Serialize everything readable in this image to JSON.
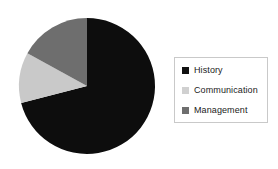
{
  "chart_data": {
    "type": "pie",
    "title": "",
    "categories": [
      "History",
      "Communication",
      "Management"
    ],
    "values": [
      71,
      12,
      17
    ],
    "unit": "percent",
    "slices": [
      {
        "label": "History",
        "value": 71,
        "color": "#0d0d0d",
        "start_angle_deg": 0,
        "end_angle_deg": 255.6
      },
      {
        "label": "Communication",
        "value": 12,
        "color": "#c9c9c9",
        "start_angle_deg": 255.6,
        "end_angle_deg": 298.8
      },
      {
        "label": "Management",
        "value": 17,
        "color": "#6e6e6e",
        "start_angle_deg": 298.8,
        "end_angle_deg": 360
      }
    ],
    "legend_position": "right",
    "grid": false,
    "xlabel": "",
    "ylabel": ""
  },
  "legend": {
    "items": [
      {
        "label": "History",
        "color": "#111111"
      },
      {
        "label": "Communication",
        "color": "#d0d0d0"
      },
      {
        "label": "Management",
        "color": "#6e6e6e"
      }
    ]
  },
  "geometry": {
    "center_x": 87,
    "center_y": 86,
    "radius": 68
  },
  "colors": {
    "background": "#ffffff",
    "legend_border": "#c9c9c9",
    "text": "#1b1b1b"
  }
}
